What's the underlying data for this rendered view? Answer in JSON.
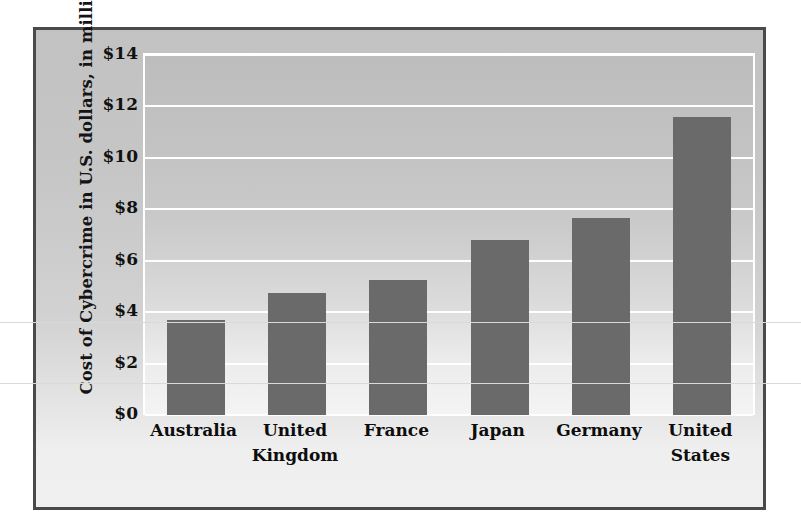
{
  "chart_data": {
    "type": "bar",
    "title": "",
    "subtitle": "",
    "xlabel": "",
    "ylabel": "Cost of Cybercrime in U.S. dollars, in millions",
    "categories": [
      "Australia",
      "United Kingdom",
      "France",
      "Japan",
      "Germany",
      "United States"
    ],
    "category_lines": [
      [
        "Australia"
      ],
      [
        "United",
        "Kingdom"
      ],
      [
        "France"
      ],
      [
        "Japan"
      ],
      [
        "Germany"
      ],
      [
        "United",
        "States"
      ]
    ],
    "values": [
      3.7,
      4.75,
      5.25,
      6.8,
      7.65,
      11.6
    ],
    "ylim": [
      0,
      14
    ],
    "ytick_step": 2,
    "ytick_labels": [
      "$0",
      "$2",
      "$4",
      "$6",
      "$8",
      "$10",
      "$12",
      "$14"
    ],
    "ytick_values": [
      0,
      2,
      4,
      6,
      8,
      10,
      12,
      14
    ],
    "grid": true,
    "grid_color": "#ffffff",
    "legend": false,
    "legend_position": "none",
    "bar_color": "#6a6a6a",
    "plot_background_top": "#bdbdbd",
    "plot_background_bottom": "#f4f4f4",
    "frame_border_color": "#4a4a4a",
    "axis_text_color": "#111111"
  },
  "figure": {
    "y_axis_title": "Cost of Cybercrime in U.S. dollars, in millions"
  }
}
